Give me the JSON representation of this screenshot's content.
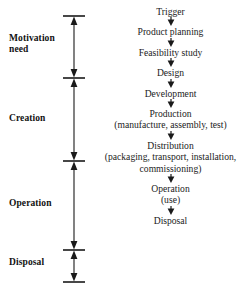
{
  "figure": {
    "type": "product-lifecycle-flow-diagram",
    "orientation": "vertical",
    "ink_color": "#1a1a1a",
    "background_color": "#ffffff"
  },
  "stages": [
    {
      "id": "motivation-need",
      "label": "Motivation\nneed",
      "span_start_y": 16,
      "span_end_y": 78
    },
    {
      "id": "creation",
      "label": "Creation",
      "span_start_y": 78,
      "span_end_y": 161
    },
    {
      "id": "operation",
      "label": "Operation",
      "span_start_y": 161,
      "span_end_y": 250
    },
    {
      "id": "disposal",
      "label": "Disposal",
      "span_start_y": 250,
      "span_end_y": 282
    }
  ],
  "axis": {
    "tick_positions_y": [
      16,
      78,
      161,
      250,
      282
    ],
    "arrow_icon": "double-headed-vertical-arrow",
    "tick_icon": "horizontal-tick-cap"
  },
  "flow": {
    "arrow_icon": "arrow-down-icon",
    "steps": [
      {
        "id": "trigger",
        "label": "Trigger"
      },
      {
        "id": "product-planning",
        "label": "Product planning"
      },
      {
        "id": "feasibility-study",
        "label": "Feasibility study"
      },
      {
        "id": "design",
        "label": "Design"
      },
      {
        "id": "development",
        "label": "Development"
      },
      {
        "id": "production",
        "label": "Production\n(manufacture, assembly, test)"
      },
      {
        "id": "distribution",
        "label": "Distribution\n(packaging, transport, installation,\ncommissioning)"
      },
      {
        "id": "operation",
        "label": "Operation\n(use)"
      },
      {
        "id": "disposal",
        "label": "Disposal"
      }
    ]
  }
}
